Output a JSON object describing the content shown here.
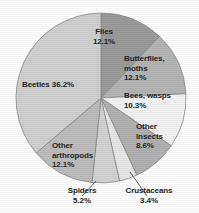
{
  "chart_data": {
    "type": "pie",
    "title": "",
    "subtitle": "",
    "xlabel": "",
    "ylabel": "",
    "legend_position": "none",
    "grid": false,
    "units": "percent",
    "total": 100.0,
    "start_angle_deg": 0,
    "direction": "clockwise",
    "categories": [
      "Flies",
      "Butterflies, moths",
      "Bees, wasps",
      "Other insects",
      "Crustaceans",
      "Spiders",
      "Other arthropods",
      "Beetles"
    ],
    "values": [
      12.1,
      12.1,
      10.3,
      8.6,
      3.4,
      5.2,
      12.1,
      36.2
    ],
    "slices": [
      {
        "name": "flies",
        "label": "Flies",
        "value": 12.1,
        "value_text": "12.1%",
        "label_text": "Flies\n12.1%",
        "color": "#9a9a9a",
        "label_placement": "inside"
      },
      {
        "name": "butterflies-moths",
        "label": "Butterflies, moths",
        "value": 12.1,
        "value_text": "12.1%",
        "label_text": "Butterflies,\nmoths\n12.1%",
        "color": "#b4b4b4",
        "label_placement": "inside"
      },
      {
        "name": "bees-wasps",
        "label": "Bees, wasps",
        "value": 10.3,
        "value_text": "10.3%",
        "label_text": "Bees, wasps\n10.3%",
        "color": "#f2f2f2",
        "label_placement": "inside"
      },
      {
        "name": "other-insects",
        "label": "Other insects",
        "value": 8.6,
        "value_text": "8.6%",
        "label_text": "Other\ninsects\n8.6%",
        "color": "#b0b0b0",
        "label_placement": "inside"
      },
      {
        "name": "crustaceans",
        "label": "Crustaceans",
        "value": 3.4,
        "value_text": "3.4%",
        "label_text": "Crustaceans\n3.4%",
        "color": "#e6e6e6",
        "label_placement": "outside-leader"
      },
      {
        "name": "spiders",
        "label": "Spiders",
        "value": 5.2,
        "value_text": "5.2%",
        "label_text": "Spiders\n5.2%",
        "color": "#d2d2d2",
        "label_placement": "outside-leader"
      },
      {
        "name": "other-arthropods",
        "label": "Other arthropods",
        "value": 12.1,
        "value_text": "12.1%",
        "label_text": "Other\narthropods\n12.1%",
        "color": "#bcbcbc",
        "label_placement": "inside"
      },
      {
        "name": "beetles",
        "label": "Beetles",
        "value": 36.2,
        "value_text": "36.2%",
        "label_text": "Beetles 36.2%",
        "color": "#cfcfcf",
        "label_placement": "inside"
      }
    ],
    "geometry": {
      "center_x": 101,
      "center_y": 98,
      "radius": 85
    },
    "colors": {
      "outline": "#8a8a8a",
      "leader_line": "#4a4a4a",
      "text": "#262626",
      "background": "#fdfdfd"
    }
  }
}
